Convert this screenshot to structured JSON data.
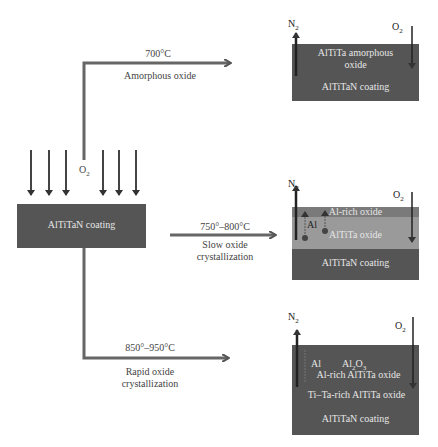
{
  "source": {
    "label": "AlTiTaN coating",
    "gas_in": "O",
    "gas_in_sub": "2"
  },
  "branches": [
    {
      "temperature": "700°C",
      "description": "Amorphous oxide",
      "result": {
        "n2": "N",
        "n2_sub": "2",
        "o2": "O",
        "o2_sub": "2",
        "layers": [
          {
            "label_line1": "AlTiTa amorphous",
            "label_line2": "oxide"
          },
          {
            "label": "AlTiTaN coating"
          }
        ]
      }
    },
    {
      "temperature": "750°–800°C",
      "description_line1": "Slow oxide",
      "description_line2": "crystallization",
      "result": {
        "n2": "N",
        "n2_sub": "2",
        "o2": "O",
        "o2_sub": "2",
        "diffusion_label": "Al",
        "layers": [
          {
            "label": "Al-rich oxide"
          },
          {
            "label": "AlTiTa oxide"
          },
          {
            "label": "AlTiTaN coating"
          }
        ]
      }
    },
    {
      "temperature": "850°–950°C",
      "description_line1": "Rapid oxide",
      "description_line2": "crystallization",
      "result": {
        "n2": "N",
        "n2_sub": "2",
        "o2": "O",
        "o2_sub": "2",
        "diffusion_label": "Al",
        "al2o3": "Al",
        "al2o3_sub1": "2",
        "al2o3_mid": "O",
        "al2o3_sub2": "3",
        "layers": [
          {
            "label": "Al-rich AlTiTa oxide"
          },
          {
            "label": "Ti–Ta-rich AlTiTa oxide"
          },
          {
            "label": "AlTiTaN coating"
          }
        ]
      }
    }
  ],
  "colors": {
    "dark_box": "#555555",
    "light_oxide": "#9a9a9a",
    "mid_oxide": "#7a7a7a",
    "arrow": "#4a4a4a"
  }
}
